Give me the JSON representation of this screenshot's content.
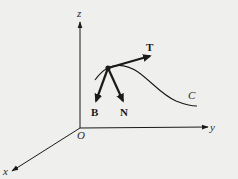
{
  "diagram": {
    "type": "frenet-serret-frame",
    "axes": {
      "z_label": "z",
      "y_label": "y",
      "x_label": "x",
      "origin_label": "O"
    },
    "curve": {
      "label": "C"
    },
    "vectors": {
      "tangent_label": "T",
      "normal_label": "N",
      "binormal_label": "B"
    },
    "colors": {
      "background": "#efefed",
      "ink": "#1a1a1a"
    }
  }
}
